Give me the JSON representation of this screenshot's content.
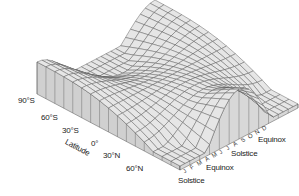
{
  "chart_data": {
    "type": "surface3d",
    "title": "",
    "x_axis": {
      "label": "Latitude",
      "ticks": [
        "90°S",
        "60°S",
        "30°S",
        "0°",
        "30°N",
        "60°N"
      ]
    },
    "y_axis": {
      "label": "",
      "ticks": [
        "J",
        "F",
        "M",
        "A",
        "M",
        "J",
        "J",
        "A",
        "S",
        "O",
        "N",
        "D"
      ]
    },
    "annotations": [
      "Solstice",
      "Equinox",
      "Solstice",
      "Equinox"
    ],
    "grid": false
  },
  "labels": {
    "lat_90s": "90°S",
    "lat_60s": "60°S",
    "lat_30s": "30°S",
    "lat_0": "0°",
    "lat_30n": "30°N",
    "lat_60n": "60°N",
    "latitude_axis": "Latitude",
    "solstice_1": "Solstice",
    "equinox_1": "Equinox",
    "solstice_2": "Solstice",
    "equinox_2": "Equinox"
  },
  "months": [
    "J",
    "F",
    "M",
    "A",
    "M",
    "J",
    "J",
    "A",
    "S",
    "O",
    "N",
    "D"
  ],
  "colors": {
    "surface": "#e6e6e6",
    "side": "#d0d0d0",
    "line": "#555555",
    "text": "#222222"
  }
}
